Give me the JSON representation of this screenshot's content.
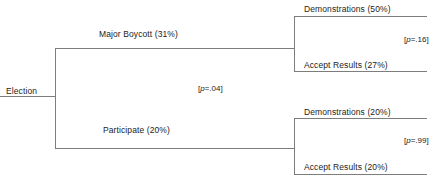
{
  "figure": {
    "type": "decision-tree-diagram",
    "line_color": "#7d7d7d",
    "text_color": "#232323",
    "background": "#ffffff"
  },
  "root": {
    "label": "Election"
  },
  "branches": [
    {
      "label": "Major Boycott   (31%)",
      "outcome": "Major Boycott",
      "percent": "31%",
      "p_value": "[p=.16]",
      "p_symbol": "p",
      "p_prefix": "[",
      "p_body": "=.16]",
      "leaves": [
        {
          "label": "Demonstrations  (50%)",
          "outcome": "Demonstrations",
          "percent": "50%"
        },
        {
          "label": "Accept Results  (27%)",
          "outcome": "Accept Results",
          "percent": "27%"
        }
      ]
    },
    {
      "label": "Participate   (20%)",
      "outcome": "Participate",
      "percent": "20%",
      "p_value": "[p=.99]",
      "p_symbol": "p",
      "p_prefix": "[",
      "p_body": "=.99]",
      "leaves": [
        {
          "label": "Demonstrations  (20%)",
          "outcome": "Demonstrations",
          "percent": "20%"
        },
        {
          "label": "Accept Results  (20%)",
          "outcome": "Accept Results",
          "percent": "20%"
        }
      ]
    }
  ],
  "root_split": {
    "p_value": "[p=.04]",
    "p_symbol": "p",
    "p_prefix": "[",
    "p_body": "=.04]"
  }
}
